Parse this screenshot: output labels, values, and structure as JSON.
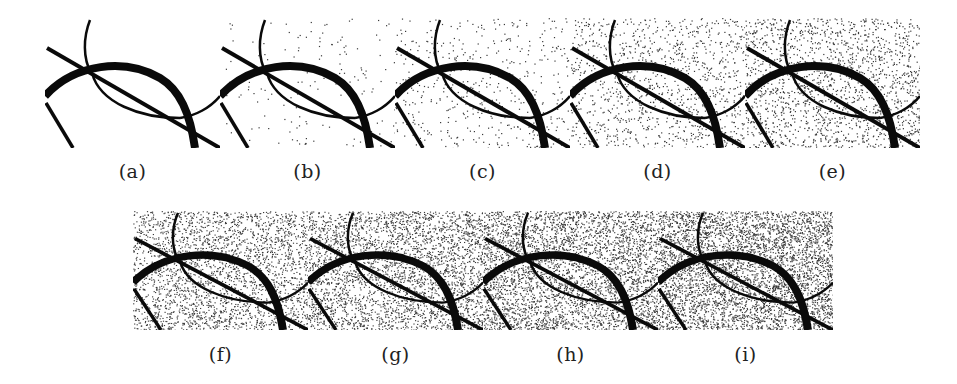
{
  "figure": {
    "top_row": [
      {
        "id": "a",
        "caption": "(a)",
        "noise_density": 0
      },
      {
        "id": "b",
        "caption": "(b)",
        "noise_density": 0.02
      },
      {
        "id": "c",
        "caption": "(c)",
        "noise_density": 0.06
      },
      {
        "id": "d",
        "caption": "(d)",
        "noise_density": 0.14
      },
      {
        "id": "e",
        "caption": "(e)",
        "noise_density": 0.22
      }
    ],
    "bottom_row": [
      {
        "id": "f",
        "caption": "(f)",
        "noise_density": 0.34
      },
      {
        "id": "g",
        "caption": "(g)",
        "noise_density": 0.42
      },
      {
        "id": "h",
        "caption": "(h)",
        "noise_density": 0.5
      },
      {
        "id": "i",
        "caption": "(i)",
        "noise_density": 0.58
      }
    ],
    "colors": {
      "stroke": "#0a0a0a",
      "noise": "#3a3a3a",
      "background": "#ffffff"
    }
  }
}
